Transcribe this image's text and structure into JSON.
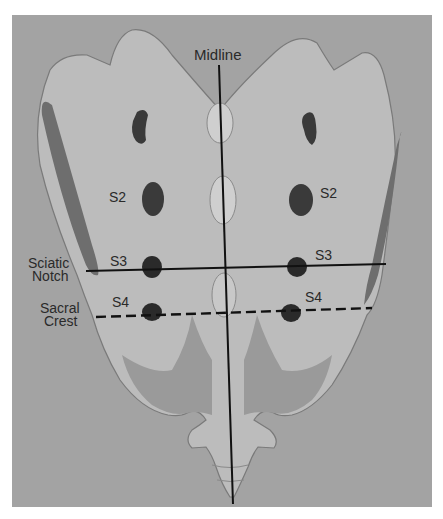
{
  "figure": {
    "colors": {
      "background": "#a3a3a3",
      "bone": "#bcbcbc",
      "bone_shadow": "#8e8e8e",
      "dark_shadow": "#6e6e6e",
      "foramen": "#3a3a3a",
      "line": "#111111",
      "text": "#2a2a2a"
    },
    "labels": {
      "midline": "Midline",
      "sciatic_notch": "Sciatic\nNotch",
      "sciatic_notch_line1": "Sciatic",
      "sciatic_notch_line2": "Notch",
      "sacral_crest_line1": "Sacral",
      "sacral_crest_line2": "Crest",
      "left_s2": "S2",
      "right_s2": "S2",
      "left_s3": "S3",
      "right_s3": "S3",
      "left_s4": "S4",
      "right_s4": "S4"
    },
    "reference_lines": [
      {
        "name": "midline",
        "style": "solid",
        "orientation": "vertical"
      },
      {
        "name": "sciatic-notch-line",
        "style": "solid",
        "orientation": "horizontal"
      },
      {
        "name": "sacral-crest-line",
        "style": "dashed",
        "orientation": "horizontal"
      }
    ]
  }
}
